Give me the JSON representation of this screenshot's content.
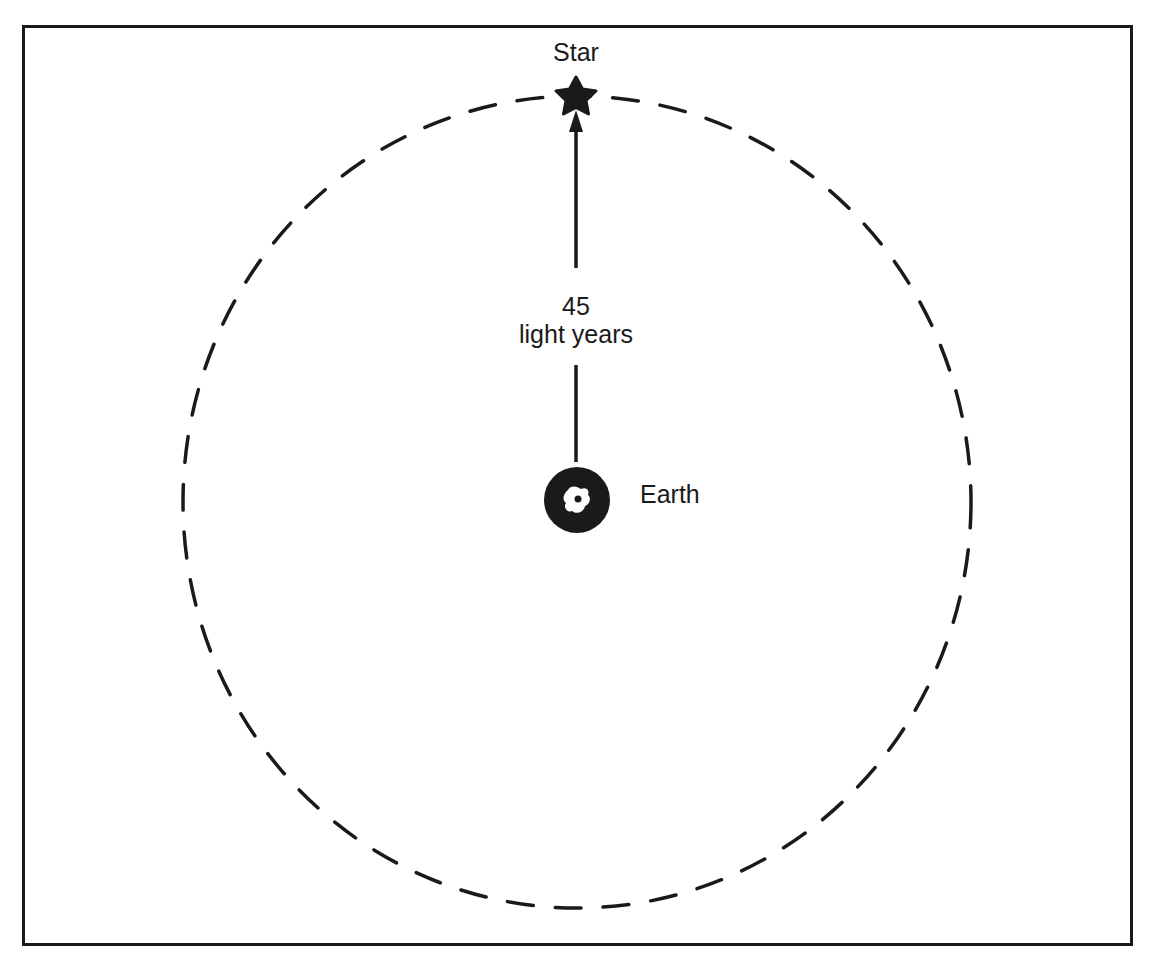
{
  "diagram": {
    "star": {
      "label": "Star",
      "icon": "star-icon",
      "color": "#1a1a1a"
    },
    "earth": {
      "label": "Earth",
      "icon": "earth-globe-icon",
      "color": "#1a1a1a"
    },
    "distance": {
      "value": "45",
      "unit": "light years"
    },
    "boundary": {
      "style": "dashed-circle",
      "meaning": "radius equal to star distance from Earth"
    }
  }
}
